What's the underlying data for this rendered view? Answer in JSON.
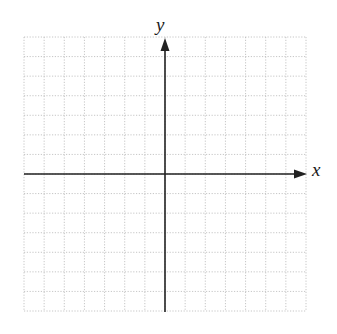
{
  "diagram": {
    "type": "cartesian-coordinate-grid",
    "axes": {
      "x_label": "x",
      "y_label": "y"
    },
    "grid": {
      "columns": 14,
      "rows": 14,
      "columns_left_of_origin": 7,
      "columns_right_of_origin": 7,
      "rows_above_origin": 7,
      "rows_below_origin": 7,
      "line_style": "dotted"
    },
    "colors": {
      "background": "#ffffff",
      "grid_line": "#b8b8b8",
      "axis": "#222222"
    }
  }
}
